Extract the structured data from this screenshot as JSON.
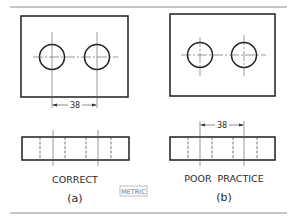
{
  "figure": {
    "left_panel": {
      "caption": "CORRECT",
      "sublabel": "(a)",
      "dimension": "38"
    },
    "right_panel": {
      "caption": "POOR  PRACTICE",
      "sublabel": "(b)",
      "dimension": "38"
    },
    "units_badge": "METRIC"
  },
  "colors": {
    "line": "#1e1e1e",
    "thin_line": "#555555",
    "rule": "#888888"
  }
}
